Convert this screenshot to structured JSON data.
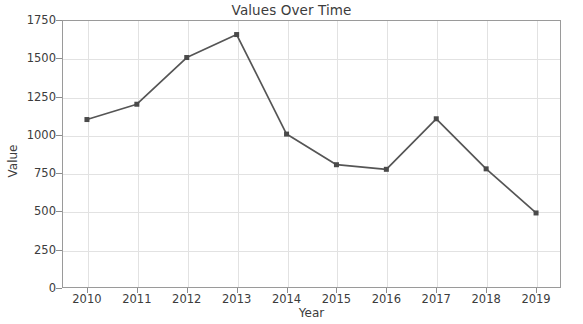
{
  "chart_data": {
    "type": "line",
    "title": "Values Over Time",
    "xlabel": "Year",
    "ylabel": "Value",
    "categories": [
      "2010",
      "2011",
      "2012",
      "2013",
      "2014",
      "2015",
      "2016",
      "2017",
      "2018",
      "2019"
    ],
    "x": [
      2010,
      2011,
      2012,
      2013,
      2014,
      2015,
      2016,
      2017,
      2018,
      2019
    ],
    "values": [
      1100,
      1200,
      1505,
      1655,
      1005,
      805,
      775,
      1105,
      778,
      490
    ],
    "series": [
      {
        "name": "Value",
        "values": [
          1100,
          1200,
          1505,
          1655,
          1005,
          805,
          775,
          1105,
          778,
          490
        ]
      }
    ],
    "ylim": [
      0,
      1750
    ],
    "xlim": [
      2009.5,
      2019.5
    ],
    "yticks": [
      0,
      250,
      500,
      750,
      1000,
      1250,
      1500,
      1750
    ],
    "ytick_labels": [
      "0",
      "250",
      "500",
      "750",
      "1000",
      "1250",
      "1500",
      "1750"
    ],
    "xticks": [
      2010,
      2011,
      2012,
      2013,
      2014,
      2015,
      2016,
      2017,
      2018,
      2019
    ],
    "xtick_labels": [
      "2010",
      "2011",
      "2012",
      "2013",
      "2014",
      "2015",
      "2016",
      "2017",
      "2018",
      "2019"
    ],
    "grid": true,
    "legend": false,
    "line_color": "#555555",
    "marker_color": "#4a4a4a",
    "marker": "square",
    "grid_color": "#e2e2e2",
    "axes_color": "#9a9a9a",
    "background_color": "#ffffff"
  }
}
